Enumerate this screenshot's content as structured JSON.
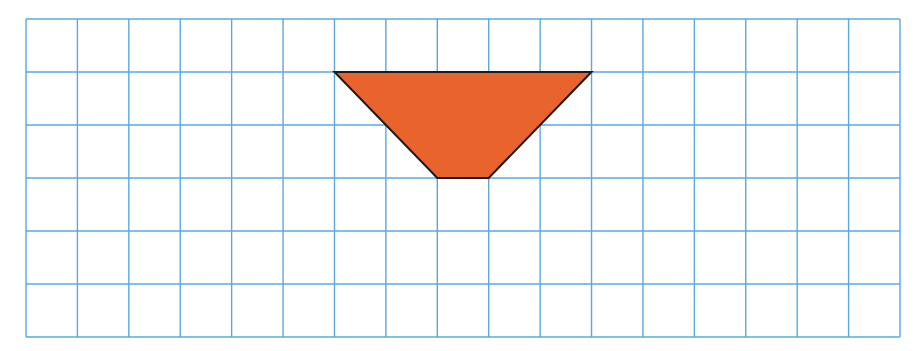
{
  "diagram": {
    "type": "grid-with-shape",
    "grid": {
      "left": 26,
      "top": 19,
      "right": 900,
      "bottom": 337,
      "columns": 17,
      "rows": 6,
      "line_color": "#5AA8E0",
      "line_width": 1.4,
      "background": "#ffffff"
    },
    "shape": {
      "kind": "trapezoid",
      "grid_vertices": [
        [
          6,
          1
        ],
        [
          11,
          1
        ],
        [
          9,
          3
        ],
        [
          8,
          3
        ]
      ],
      "pixel_vertices": [
        [
          334,
          72
        ],
        [
          589,
          72
        ],
        [
          487,
          178
        ],
        [
          437,
          178
        ]
      ],
      "fill": "#E8642C",
      "stroke": "#1a1a1a",
      "stroke_width": 2
    }
  }
}
